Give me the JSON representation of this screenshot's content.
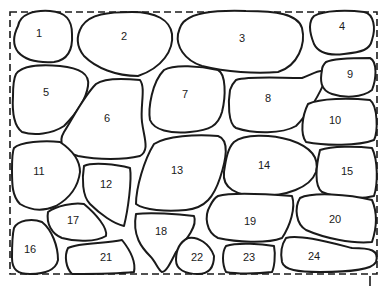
{
  "diagram": {
    "type": "stone-paving-pattern",
    "frame": {
      "x": 10,
      "y": 12,
      "width": 367,
      "height": 262,
      "style": "dashed"
    },
    "colors": {
      "stroke": "#1a1a1a",
      "fill": "#ffffff",
      "background": "#ffffff"
    },
    "stones": [
      {
        "id": "1",
        "label": "1",
        "lx": 39,
        "ly": 34,
        "path": "M18,26 C20,14 34,10 50,11 C66,12 72,20 72,34 C73,50 68,60 54,62 C38,63 26,61 18,52 C12,44 14,34 18,26 Z"
      },
      {
        "id": "2",
        "label": "2",
        "lx": 124,
        "ly": 37,
        "path": "M82,26 C90,14 108,12 132,12 C156,12 170,20 172,34 C174,50 162,68 138,76 C116,76 96,68 84,56 C76,46 76,36 82,26 Z"
      },
      {
        "id": "3",
        "label": "3",
        "lx": 242,
        "ly": 39,
        "path": "M186,20 C196,12 216,10 246,11 C276,11 298,14 302,28 C306,44 298,66 278,72 C256,74 226,72 202,66 C184,60 176,46 178,34 C180,26 182,22 186,20 Z"
      },
      {
        "id": "4",
        "label": "4",
        "lx": 342,
        "ly": 27,
        "path": "M314,16 C324,10 348,10 364,12 C374,14 376,28 372,40 C370,50 362,52 344,54 C328,56 318,52 314,44 C310,34 308,22 314,16 Z"
      },
      {
        "id": "5",
        "label": "5",
        "lx": 46,
        "ly": 93,
        "path": "M16,74 C22,66 36,64 60,66 C80,68 90,74 88,86 C86,100 76,114 64,126 C52,134 34,136 22,132 C14,126 12,112 13,96 C13,86 14,78 16,74 Z"
      },
      {
        "id": "6",
        "label": "6",
        "lx": 107,
        "ly": 119,
        "path": "M96,84 C104,78 120,78 140,80 C146,88 140,106 142,122 C144,138 150,150 140,156 C124,160 98,160 78,156 C62,152 58,142 64,132 C74,116 84,96 96,84 Z"
      },
      {
        "id": "7",
        "label": "7",
        "lx": 185,
        "ly": 95,
        "path": "M164,70 C174,64 200,66 218,70 C226,74 226,96 222,112 C218,126 210,130 190,132 C170,134 154,130 150,120 C148,108 152,82 164,70 Z"
      },
      {
        "id": "8",
        "label": "8",
        "lx": 268,
        "ly": 99,
        "path": "M236,80 C250,76 276,78 302,78 C318,72 324,66 326,78 C320,94 308,114 296,126 C282,134 254,134 236,128 C228,124 228,102 230,90 C232,84 234,82 236,80 Z"
      },
      {
        "id": "9",
        "label": "9",
        "lx": 350,
        "ly": 75,
        "path": "M326,62 C334,58 356,58 370,58 C378,62 376,80 372,90 C362,98 344,98 332,94 C320,90 320,80 322,70 C322,66 324,64 326,62 Z"
      },
      {
        "id": "10",
        "label": "10",
        "lx": 335,
        "ly": 121,
        "path": "M308,104 C320,98 350,98 370,100 C378,106 378,132 374,140 C358,146 326,146 306,142 C300,134 302,116 308,104 Z"
      },
      {
        "id": "11",
        "label": "11",
        "lx": 39,
        "ly": 172,
        "path": "M14,148 C20,142 44,140 60,142 C72,150 80,160 80,172 C78,188 70,198 56,206 C42,212 30,210 20,204 C12,196 12,184 12,170 C12,160 12,152 14,148 Z"
      },
      {
        "id": "12",
        "label": "12",
        "lx": 106,
        "ly": 185,
        "path": "M84,166 C92,162 116,164 130,168 C132,180 128,210 124,226 C114,224 100,214 90,204 C82,196 82,178 84,166 Z"
      },
      {
        "id": "13",
        "label": "13",
        "lx": 177,
        "ly": 171,
        "path": "M154,144 C166,136 196,134 218,136 C230,140 226,160 220,178 C214,196 206,208 186,210 C166,212 144,210 136,204 C136,188 144,160 154,144 Z"
      },
      {
        "id": "14",
        "label": "14",
        "lx": 264,
        "ly": 166,
        "path": "M234,142 C244,134 270,134 290,140 C308,146 320,156 316,172 C310,188 286,196 260,196 C236,196 222,188 224,172 C226,158 228,148 234,142 Z"
      },
      {
        "id": "15",
        "label": "15",
        "lx": 347,
        "ly": 172,
        "path": "M320,150 C332,146 356,146 372,148 C378,160 378,184 374,196 C360,200 336,198 322,192 C314,186 316,166 320,150 Z"
      },
      {
        "id": "16",
        "label": "16",
        "lx": 30,
        "ly": 250,
        "path": "M14,228 C18,220 32,218 42,222 C52,230 58,246 58,260 C56,270 44,274 30,274 C18,274 12,270 12,258 C12,246 12,236 14,228 Z"
      },
      {
        "id": "17",
        "label": "17",
        "lx": 73,
        "ly": 221,
        "path": "M48,212 C56,206 74,202 84,204 C96,214 108,228 106,236 C96,242 76,242 62,238 C52,234 46,224 48,212 Z"
      },
      {
        "id": "18",
        "label": "18",
        "lx": 161,
        "ly": 232,
        "path": "M136,214 C150,212 178,214 194,216 C198,226 186,240 176,252 C170,264 166,272 162,272 C158,270 156,262 150,256 C142,248 132,236 136,214 Z"
      },
      {
        "id": "19",
        "label": "19",
        "lx": 250,
        "ly": 222,
        "path": "M218,196 C232,192 266,194 292,196 C296,208 290,226 282,238 C266,244 236,242 218,238 C206,232 204,216 210,206 C212,202 214,198 218,196 Z"
      },
      {
        "id": "20",
        "label": "20",
        "lx": 335,
        "ly": 220,
        "path": "M300,198 C312,192 348,194 372,200 C378,214 376,230 372,242 C352,244 324,238 306,230 C296,224 294,208 300,198 Z"
      },
      {
        "id": "21",
        "label": "21",
        "lx": 106,
        "ly": 258,
        "path": "M68,248 C80,242 106,244 122,240 C130,250 136,262 134,272 C116,274 90,274 72,274 C66,268 64,256 68,248 Z"
      },
      {
        "id": "22",
        "label": "22",
        "lx": 197,
        "ly": 258,
        "path": "M188,238 C198,236 210,244 214,256 C214,266 210,274 198,274 C186,274 176,270 176,260 C176,250 180,242 188,238 Z"
      },
      {
        "id": "23",
        "label": "23",
        "lx": 249,
        "ly": 258,
        "path": "M226,246 C238,242 262,244 274,246 C276,256 274,268 272,272 C256,274 236,274 226,272 C222,264 222,252 226,246 Z"
      },
      {
        "id": "24",
        "label": "24",
        "lx": 314,
        "ly": 257,
        "path": "M286,238 C298,234 328,242 352,248 C370,248 380,250 376,262 C372,270 350,272 320,272 C298,272 284,270 282,262 C280,252 282,244 286,238 Z"
      }
    ],
    "corner_tick": {
      "x1": 370,
      "y1": 276,
      "x2": 370,
      "y2": 286
    }
  }
}
